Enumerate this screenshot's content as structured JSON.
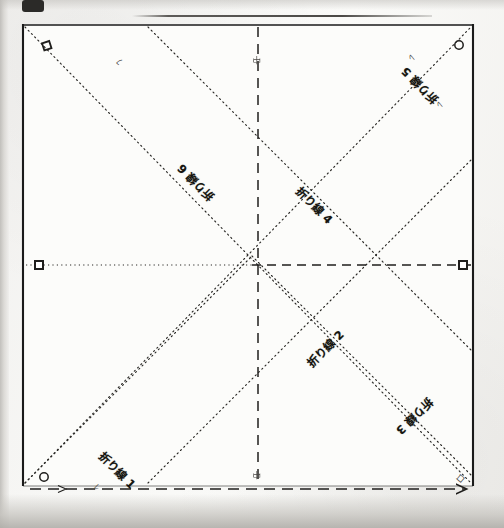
{
  "document": {
    "kind": "scanned-origami-fold-diagram",
    "sheet_label": "square sheet",
    "ink_color": "#1a1a1a",
    "paper_color": "#fafaf8",
    "scan_background": "#efeeec"
  },
  "figure": {
    "outline_name": "square-outline",
    "center_name": "center-point",
    "fold_lines": [
      {
        "id": "fold-1",
        "label": "折り線 1",
        "kind": "diagonal",
        "note": "lower-left offset diagonal"
      },
      {
        "id": "fold-2",
        "label": "折り線 2",
        "kind": "diagonal",
        "note": "lower-right offset diagonal"
      },
      {
        "id": "fold-3",
        "label": "折り線 3",
        "kind": "diagonal",
        "note": "lower-right outer diagonal"
      },
      {
        "id": "fold-4",
        "label": "折り線 4",
        "kind": "diagonal",
        "note": "upper-right inner diagonal"
      },
      {
        "id": "fold-5",
        "label": "折り線 5",
        "kind": "diagonal",
        "note": "upper-right outer diagonal"
      },
      {
        "id": "fold-6",
        "label": "折り線 6",
        "kind": "diagonal",
        "note": "upper-left main diagonal"
      }
    ],
    "axis_lines": [
      {
        "id": "axis-vertical",
        "label": "中",
        "style": "dashed",
        "orientation": "vertical"
      },
      {
        "id": "axis-horizontal-left",
        "style": "dotted",
        "orientation": "horizontal"
      },
      {
        "id": "axis-horizontal-right",
        "style": "dashed",
        "orientation": "horizontal"
      },
      {
        "id": "axis-bottom",
        "style": "dashed",
        "orientation": "horizontal"
      }
    ],
    "markers": [
      {
        "id": "marker-top-left",
        "glyph": "square",
        "letter": "ロ"
      },
      {
        "id": "marker-top-right",
        "glyph": "circle",
        "letter": "の"
      },
      {
        "id": "marker-mid-left",
        "glyph": "square",
        "letter": ""
      },
      {
        "id": "marker-mid-right",
        "glyph": "square",
        "letter": ""
      },
      {
        "id": "marker-bottom-left",
        "glyph": "circle",
        "letter": "の"
      },
      {
        "id": "marker-bottom-right",
        "glyph": "arrow",
        "letter": ""
      }
    ],
    "tick_letters": [
      {
        "id": "tick-top-left-inner",
        "text": "ﾌ"
      },
      {
        "id": "tick-top-right-outer",
        "text": "ﾚ"
      },
      {
        "id": "tick-top-right-inner",
        "text": "ﾚ"
      },
      {
        "id": "tick-center-top",
        "text": "中"
      },
      {
        "id": "tick-center-bottom",
        "text": "中"
      },
      {
        "id": "tick-bottom-left",
        "text": "ﾚ"
      },
      {
        "id": "tick-bottom-right-inner",
        "text": "ﾌ"
      },
      {
        "id": "tick-bottom-right-outer",
        "text": "ロ"
      },
      {
        "id": "tick-bottom-mid-left",
        "text": "＿"
      }
    ]
  }
}
